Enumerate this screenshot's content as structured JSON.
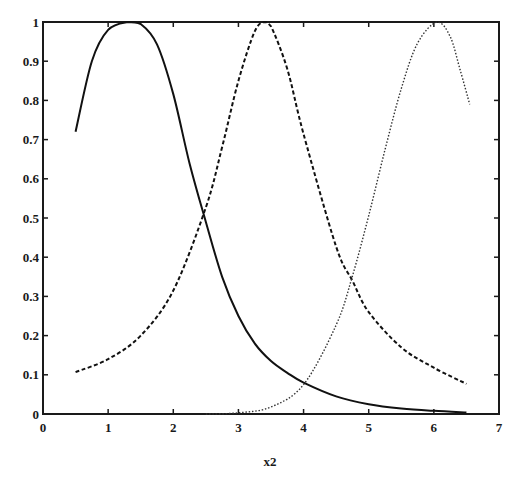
{
  "chart_data": {
    "type": "line",
    "title": "",
    "xlabel": "x2",
    "ylabel": "",
    "xlim": [
      0,
      7
    ],
    "ylim": [
      0,
      1
    ],
    "grid": false,
    "legend": null,
    "x_ticks": [
      "0",
      "1",
      "2",
      "3",
      "4",
      "5",
      "6",
      "7"
    ],
    "y_ticks": [
      "0",
      "0.1",
      "0.2",
      "0.3",
      "0.4",
      "0.5",
      "0.6",
      "0.7",
      "0.8",
      "0.9",
      "1"
    ],
    "series": [
      {
        "name": "membership function 1 (solid)",
        "style": "solid",
        "peak_x": 1.3,
        "x": [
          0.5,
          0.75,
          1.0,
          1.3,
          1.5,
          1.75,
          2.0,
          2.25,
          2.5,
          2.75,
          3.0,
          3.25,
          3.5,
          3.75,
          4.0,
          4.5,
          5.0,
          5.5,
          6.0,
          6.5
        ],
        "y": [
          0.72,
          0.9,
          0.98,
          1.0,
          0.995,
          0.943,
          0.816,
          0.639,
          0.49,
          0.35,
          0.25,
          0.18,
          0.135,
          0.105,
          0.08,
          0.045,
          0.025,
          0.014,
          0.008,
          0.004
        ]
      },
      {
        "name": "membership function 2 (dashed)",
        "style": "dashed",
        "peak_x": 3.4,
        "x": [
          0.5,
          1.0,
          1.5,
          2.0,
          2.5,
          2.75,
          3.0,
          3.25,
          3.4,
          3.5,
          3.75,
          4.0,
          4.5,
          4.75,
          5.0,
          5.5,
          6.0,
          6.5
        ],
        "y": [
          0.107,
          0.14,
          0.2,
          0.315,
          0.527,
          0.681,
          0.85,
          0.976,
          1.0,
          0.989,
          0.88,
          0.714,
          0.427,
          0.34,
          0.26,
          0.17,
          0.118,
          0.077
        ]
      },
      {
        "name": "membership function 3 (dotted)",
        "style": "dotted",
        "peak_x": 6.05,
        "x": [
          2.5,
          3.0,
          3.5,
          4.0,
          4.5,
          4.75,
          5.0,
          5.25,
          5.5,
          5.75,
          6.05,
          6.25,
          6.4,
          6.55
        ],
        "y": [
          0.0,
          0.003,
          0.018,
          0.075,
          0.227,
          0.352,
          0.506,
          0.674,
          0.83,
          0.946,
          1.0,
          0.963,
          0.88,
          0.79
        ]
      }
    ]
  }
}
